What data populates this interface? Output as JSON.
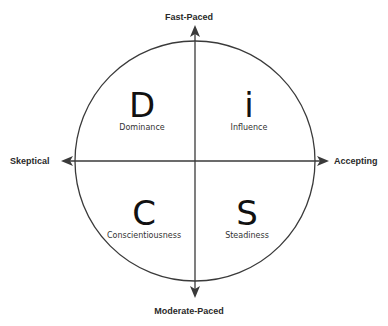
{
  "diagram": {
    "colors": {
      "line": "#3a3a3a",
      "text": "#111111",
      "background": "#ffffff"
    },
    "axes": {
      "top": "Fast-Paced",
      "bottom": "Moderate-Paced",
      "left": "Skeptical",
      "right": "Accepting"
    },
    "quadrants": [
      {
        "position": "top-left",
        "letter": "D",
        "label": "Dominance"
      },
      {
        "position": "top-right",
        "letter": "i",
        "label": "Influence"
      },
      {
        "position": "bottom-left",
        "letter": "C",
        "label": "Conscientiousness"
      },
      {
        "position": "bottom-right",
        "letter": "S",
        "label": "Steadiness"
      }
    ]
  }
}
